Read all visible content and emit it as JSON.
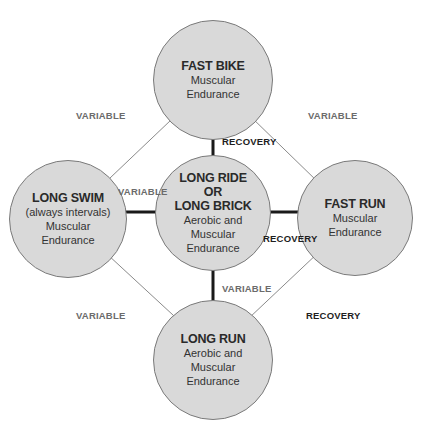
{
  "nodes": {
    "top": {
      "title": "FAST BIKE",
      "sub1": "Muscular",
      "sub2": "Endurance"
    },
    "left": {
      "title": "LONG SWIM",
      "sub1": "(always intervals)",
      "sub2": "Muscular",
      "sub3": "Endurance"
    },
    "center": {
      "title1": "LONG RIDE",
      "title2": "OR",
      "title3": "LONG BRICK",
      "sub1": "Aerobic and",
      "sub2": "Muscular",
      "sub3": "Endurance"
    },
    "right": {
      "title": "FAST RUN",
      "sub1": "Muscular",
      "sub2": "Endurance"
    },
    "bottom": {
      "title": "LONG RUN",
      "sub1": "Aerobic and",
      "sub2": "Muscular",
      "sub3": "Endurance"
    }
  },
  "labels": {
    "top_left": "VARIABLE",
    "top_right": "VARIABLE",
    "center_top": "RECOVERY",
    "center_left": "VARIABLE",
    "center_right": "RECOVERY",
    "center_bottom": "VARIABLE",
    "bottom_left": "VARIABLE",
    "bottom_right": "RECOVERY"
  },
  "colors": {
    "node_fill": "#d9d9d9",
    "thin_line": "#8a8a8a",
    "thick_line": "#1a1a1a"
  }
}
